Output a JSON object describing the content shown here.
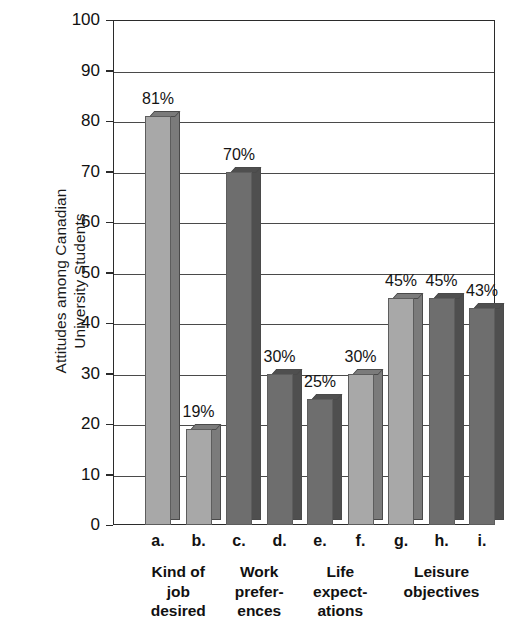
{
  "chart_data": {
    "type": "bar",
    "title": "",
    "subtitle": "",
    "xlabel": "",
    "ylabel": "Attitudes among Canadian University Students",
    "ylabel_lines": [
      "Attitudes among Canadian",
      "University Students"
    ],
    "ylim": [
      0,
      100
    ],
    "y_ticks": [
      0,
      10,
      20,
      30,
      40,
      50,
      60,
      70,
      80,
      90,
      100
    ],
    "y_tick_labels": [
      "0",
      "10",
      "20",
      "30",
      "40",
      "50",
      "60",
      "70",
      "80",
      "90",
      "100"
    ],
    "grid": true,
    "legend": "none",
    "categories": [
      "a.",
      "b.",
      "c.",
      "d.",
      "e.",
      "f.",
      "g.",
      "h.",
      "i."
    ],
    "values": [
      81,
      19,
      70,
      30,
      25,
      30,
      45,
      45,
      43
    ],
    "data_labels": [
      "81%",
      "19%",
      "70%",
      "30%",
      "25%",
      "30%",
      "45%",
      "45%",
      "43%"
    ],
    "bar_shades": [
      "light",
      "light",
      "dark",
      "dark",
      "dark",
      "light",
      "light",
      "dark",
      "dark"
    ],
    "groups": [
      {
        "label_lines": [
          "Kind of",
          "job",
          "desired"
        ],
        "members": [
          "a.",
          "b."
        ]
      },
      {
        "label_lines": [
          "Work",
          "prefer-",
          "ences"
        ],
        "members": [
          "c.",
          "d."
        ]
      },
      {
        "label_lines": [
          "Life",
          "expect-",
          "ations"
        ],
        "members": [
          "e.",
          "f."
        ]
      },
      {
        "label_lines": [
          "Leisure",
          "objectives"
        ],
        "members": [
          "g.",
          "h.",
          "i."
        ]
      }
    ],
    "colors": {
      "bar_light_face": "#a8a8a8",
      "bar_light_side": "#7b7b7b",
      "bar_dark_face": "#6e6e6e",
      "bar_dark_side": "#4f4f4f",
      "axis": "#2b2b2b",
      "grid": "#4a4a4a",
      "background": "#ffffff",
      "text": "#111111"
    }
  }
}
